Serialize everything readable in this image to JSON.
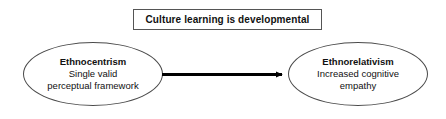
{
  "diagram": {
    "title_box": {
      "text": "Culture learning is developmental"
    },
    "nodes": [
      {
        "id": "ethnocentrism",
        "shape": "ellipse",
        "title": "Ethnocentrism",
        "lines": [
          "Single valid",
          "perceptual framework"
        ]
      },
      {
        "id": "ethnorelativism",
        "shape": "ellipse",
        "title": "Ethnorelativism",
        "lines": [
          "Increased cognitive",
          "empathy"
        ]
      }
    ],
    "connector": {
      "type": "arrow",
      "direction": "left-to-right",
      "from": "ethnocentrism",
      "to": "ethnorelativism",
      "label": ""
    },
    "colors": {
      "stroke": "#4a4a4a",
      "arrow": "#000000",
      "text": "#111111",
      "background": "#ffffff",
      "box_border": "#555555"
    }
  }
}
